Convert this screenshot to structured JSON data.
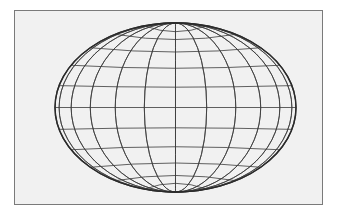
{
  "figure": {
    "kind": "wireframe-ellipsoid",
    "colors": {
      "background": "#f1f1f1",
      "frame": "#7a7a7a",
      "line": "#3a3a3a"
    },
    "ellipsoid": {
      "cx": 175.5,
      "cy": 107.5,
      "rx": 120.5,
      "ry": 84.5
    },
    "meridian_count": 12,
    "parallel_count": 12
  }
}
